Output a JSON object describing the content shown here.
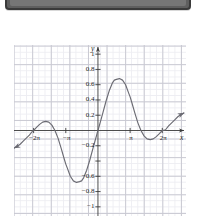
{
  "window": {
    "strip_label": ""
  },
  "chart_data": {
    "type": "line",
    "title": "",
    "subtitle": "",
    "xlabel": "x",
    "ylabel": "y",
    "grid": true,
    "minor_grid": true,
    "legend": "none",
    "xlim": [
      -8.2,
      8.6
    ],
    "ylim": [
      -1.12,
      1.12
    ],
    "x_tick_labels": [
      "−2π",
      "−π",
      "π",
      "2π"
    ],
    "x_tick_values": [
      -6.2832,
      -3.1416,
      3.1416,
      6.2832
    ],
    "y_tick_labels": [
      "1",
      "0.8",
      "0.6",
      "0.4",
      "0.2",
      "−0.2",
      "−0.4",
      "−0.6",
      "−0.8",
      "−1"
    ],
    "y_tick_values": [
      1,
      0.8,
      0.6,
      0.4,
      0.2,
      -0.2,
      -0.4,
      -0.6,
      -0.8,
      -1
    ],
    "y_tick_visible": [
      true,
      true,
      true,
      true,
      true,
      true,
      false,
      true,
      true,
      true
    ],
    "curve_color": "#6b6b73",
    "axis_color": "#3a3a3a",
    "grid_color": "#c9c9d2",
    "minor_grid_color": "#ededf2",
    "annotations": [
      {
        "text": "local maximum ≈ 0.67",
        "x": 1.6,
        "y": 0.67
      },
      {
        "text": "local minimum ≈ −0.67",
        "x": -1.6,
        "y": -0.67
      },
      {
        "text": "zero crossing",
        "x": 0,
        "y": 0
      },
      {
        "text": "zero crossing",
        "x": -6.2832,
        "y": 0
      },
      {
        "text": "zero crossing",
        "x": 6.2832,
        "y": 0
      }
    ],
    "series": [
      {
        "name": "f(x)",
        "arrow_start": true,
        "arrow_end": true,
        "x": [
          -8.2,
          -7.9,
          -7.6,
          -7.3,
          -7.0,
          -6.7,
          -6.4,
          -6.2832,
          -6.0,
          -5.7,
          -5.4,
          -5.1,
          -4.8,
          -4.5,
          -4.2,
          -3.9,
          -3.6,
          -3.3,
          -3.1416,
          -3.0,
          -2.7,
          -2.4,
          -2.1,
          -1.8,
          -1.6,
          -1.4,
          -1.1,
          -0.8,
          -0.5,
          -0.25,
          0.0,
          0.25,
          0.5,
          0.8,
          1.1,
          1.4,
          1.6,
          1.8,
          2.1,
          2.4,
          2.7,
          3.0,
          3.1416,
          3.3,
          3.6,
          3.9,
          4.2,
          4.5,
          4.8,
          5.1,
          5.4,
          5.7,
          6.0,
          6.2832,
          6.6,
          6.9,
          7.2,
          7.5,
          7.8,
          8.1,
          8.4
        ],
        "y": [
          -0.23,
          -0.21,
          -0.18,
          -0.14,
          -0.1,
          -0.06,
          -0.01,
          0.0,
          0.04,
          0.08,
          0.11,
          0.12,
          0.11,
          0.07,
          0.0,
          -0.1,
          -0.23,
          -0.37,
          -0.44,
          -0.49,
          -0.6,
          -0.66,
          -0.68,
          -0.67,
          -0.66,
          -0.62,
          -0.52,
          -0.39,
          -0.24,
          -0.12,
          0.0,
          0.12,
          0.24,
          0.39,
          0.52,
          0.62,
          0.66,
          0.67,
          0.68,
          0.66,
          0.6,
          0.49,
          0.44,
          0.37,
          0.23,
          0.1,
          0.0,
          -0.07,
          -0.11,
          -0.12,
          -0.11,
          -0.08,
          -0.04,
          0.0,
          0.01,
          0.06,
          0.1,
          0.14,
          0.18,
          0.21,
          0.23
        ]
      }
    ]
  }
}
